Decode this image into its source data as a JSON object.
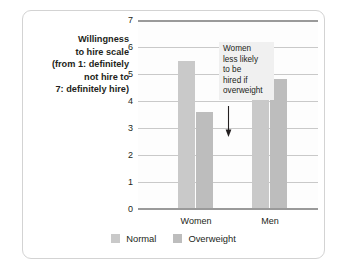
{
  "chart_data": {
    "type": "bar",
    "title": "",
    "xlabel": "",
    "ylabel_lines": [
      "Willingness",
      "to hire scale",
      "(from 1: definitely",
      "not hire to",
      "7: definitely hire)"
    ],
    "categories": [
      "Women",
      "Men"
    ],
    "series": [
      {
        "name": "Normal",
        "values": [
          5.5,
          5.9
        ],
        "color": "#c9c9c9"
      },
      {
        "name": "Overweight",
        "values": [
          3.6,
          4.8
        ],
        "color": "#bdbdbd"
      }
    ],
    "ylim": [
      0,
      7
    ],
    "yticks": [
      0,
      1,
      2,
      3,
      4,
      5,
      6,
      7
    ],
    "ytick_labels": [
      "0",
      "1",
      "2",
      "3",
      "4",
      "5",
      "6",
      "7"
    ],
    "grid": true,
    "legend_position": "bottom",
    "annotations": [
      {
        "lines": [
          "Women",
          "less likely",
          "to be",
          "hired if",
          "overweight"
        ],
        "arrow": "down",
        "points_to": "Women / Overweight bar"
      }
    ]
  },
  "legend": {
    "items": [
      {
        "label": "Normal"
      },
      {
        "label": "Overweight"
      }
    ]
  }
}
